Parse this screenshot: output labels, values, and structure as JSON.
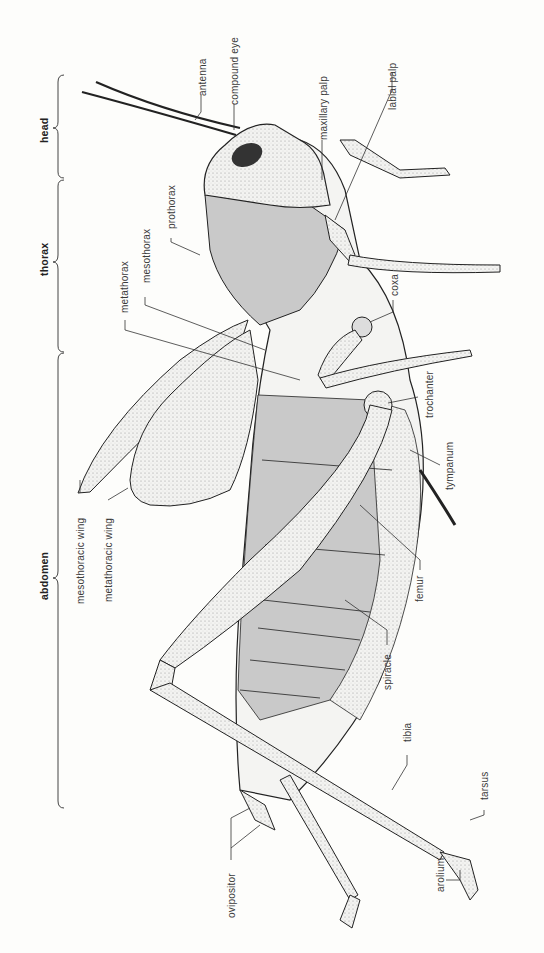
{
  "diagram": {
    "colors": {
      "background": "#fdfdfb",
      "line": "#222222",
      "shade": "#c9c9c9",
      "body": "#f4f4f2"
    },
    "regions": [
      {
        "id": "head",
        "label": "head"
      },
      {
        "id": "thorax",
        "label": "thorax"
      },
      {
        "id": "abdomen",
        "label": "abdomen"
      }
    ],
    "labels": {
      "antenna": "antenna",
      "compound_eye": "compound eye",
      "maxillary_palp": "maxillary palp",
      "labial_palp": "labial palp",
      "prothorax": "prothorax",
      "mesothorax": "mesothorax",
      "metathorax": "metathorax",
      "coxa": "coxa",
      "trochanter": "trochanter",
      "tympanum": "tympanum",
      "mesothoracic_wing": "mesothoracic wing",
      "metathoracic_wing": "metathoracic wing",
      "femur": "femur",
      "spiracle": "spiracle",
      "tibia": "tibia",
      "tarsus": "tarsus",
      "arolium": "arolium",
      "ovipositor": "ovipositor"
    }
  }
}
